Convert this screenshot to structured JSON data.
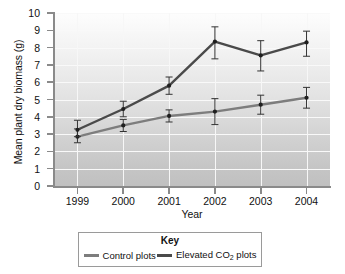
{
  "chart_data": {
    "type": "line",
    "title": "",
    "xlabel": "Year",
    "ylabel": "Mean plant dry biomass (g)",
    "categories": [
      "1999",
      "2000",
      "2001",
      "2002",
      "2003",
      "2004"
    ],
    "x": [
      1999,
      2000,
      2001,
      2002,
      2003,
      2004
    ],
    "ylim": [
      0,
      10
    ],
    "yticks": [
      "0",
      "1",
      "2",
      "3",
      "4",
      "5",
      "6",
      "7",
      "8",
      "9",
      "10"
    ],
    "grid": true,
    "legend_position": "bottom",
    "legend_title": "Key",
    "series": [
      {
        "name": "Control plots",
        "color": "#7d7d7d",
        "values": [
          2.85,
          3.5,
          4.05,
          4.3,
          4.7,
          5.1
        ],
        "error_upper": [
          0.45,
          0.35,
          0.35,
          0.75,
          0.55,
          0.6
        ],
        "error_lower": [
          0.35,
          0.35,
          0.35,
          0.75,
          0.55,
          0.6
        ]
      },
      {
        "name": "Elevated CO2 plots",
        "color": "#4a4a4a",
        "values": [
          3.25,
          4.45,
          5.8,
          8.35,
          7.55,
          8.3
        ],
        "error_upper": [
          0.55,
          0.45,
          0.5,
          0.85,
          0.85,
          0.65
        ],
        "error_lower": [
          0.4,
          0.45,
          0.5,
          1.0,
          0.9,
          0.8
        ]
      }
    ]
  },
  "legend": {
    "title": "Key",
    "items": [
      {
        "label_pre": "Control plots",
        "label_sub": "",
        "label_post": "",
        "color": "#7d7d7d"
      },
      {
        "label_pre": "Elevated CO",
        "label_sub": "2",
        "label_post": " plots",
        "color": "#4a4a4a"
      }
    ]
  },
  "axes": {
    "y_title": "Mean plant dry biomass (g)",
    "x_title": "Year"
  }
}
